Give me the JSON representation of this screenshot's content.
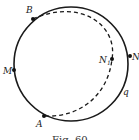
{
  "figure": {
    "caption": "Fig. 60",
    "colors": {
      "stroke": "#1a1a1a",
      "background": "#ffffff"
    },
    "circle": {
      "cx": 71,
      "cy": 64,
      "r": 57
    },
    "dashed_arc": {
      "from": "B",
      "through": "N1",
      "to": "A"
    },
    "points": [
      {
        "id": "B",
        "label": "B",
        "x": 33,
        "y": 19,
        "lx": 26,
        "ly": 13
      },
      {
        "id": "M",
        "label": "M",
        "x": 14,
        "y": 70,
        "lx": 3,
        "ly": 74
      },
      {
        "id": "A",
        "label": "A",
        "x": 44,
        "y": 116,
        "lx": 36,
        "ly": 127
      },
      {
        "id": "N1",
        "label": "N",
        "sub": "1",
        "x": 112,
        "y": 59,
        "lx": 99,
        "ly": 63
      },
      {
        "id": "N",
        "label": "N",
        "x": 130,
        "y": 56,
        "lx": 132,
        "ly": 60
      }
    ],
    "curve_label": {
      "label": "q",
      "x": 123,
      "y": 95
    }
  }
}
